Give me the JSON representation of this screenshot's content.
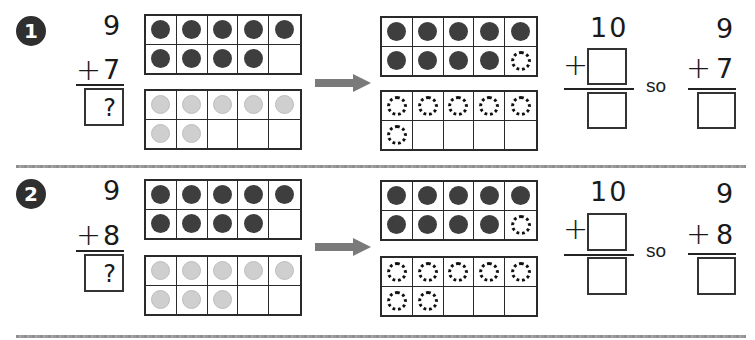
{
  "problems": [
    {
      "number": "1",
      "addend_top": "9",
      "plus": "+",
      "addend_bottom": "7",
      "answer_placeholder": "?",
      "frame_left_top": [
        "dark",
        "dark",
        "dark",
        "dark",
        "dark",
        "dark",
        "dark",
        "dark",
        "dark",
        "empty"
      ],
      "frame_left_bottom": [
        "light",
        "light",
        "light",
        "light",
        "light",
        "light",
        "light",
        "empty",
        "empty",
        "empty"
      ],
      "frame_right_top": [
        "dark",
        "dark",
        "dark",
        "dark",
        "dark",
        "dark",
        "dark",
        "dark",
        "dark",
        "dashed"
      ],
      "frame_right_bottom": [
        "dashed",
        "dashed",
        "dashed",
        "dashed",
        "dashed",
        "dashed",
        "empty",
        "empty",
        "empty",
        "empty"
      ],
      "make_ten": {
        "top": "10",
        "plus": "+",
        "addend_box": "",
        "sum_box": ""
      },
      "so_label": "so",
      "restated": {
        "top": "9",
        "plus": "+",
        "bottom": "7",
        "sum_box": ""
      }
    },
    {
      "number": "2",
      "addend_top": "9",
      "plus": "+",
      "addend_bottom": "8",
      "answer_placeholder": "?",
      "frame_left_top": [
        "dark",
        "dark",
        "dark",
        "dark",
        "dark",
        "dark",
        "dark",
        "dark",
        "dark",
        "empty"
      ],
      "frame_left_bottom": [
        "light",
        "light",
        "light",
        "light",
        "light",
        "light",
        "light",
        "light",
        "empty",
        "empty"
      ],
      "frame_right_top": [
        "dark",
        "dark",
        "dark",
        "dark",
        "dark",
        "dark",
        "dark",
        "dark",
        "dark",
        "dashed"
      ],
      "frame_right_bottom": [
        "dashed",
        "dashed",
        "dashed",
        "dashed",
        "dashed",
        "dashed",
        "dashed",
        "empty",
        "empty",
        "empty"
      ],
      "make_ten": {
        "top": "10",
        "plus": "+",
        "addend_box": "",
        "sum_box": ""
      },
      "so_label": "so",
      "restated": {
        "top": "9",
        "plus": "+",
        "bottom": "8",
        "sum_box": ""
      }
    }
  ],
  "icons": {
    "arrow": "right-arrow-icon"
  },
  "colors": {
    "dark_counter": "#3e3e3e",
    "light_counter": "#cfcfcf",
    "badge": "#2f2f2f",
    "arrow": "#7a7a7a",
    "divider": "#999999"
  }
}
